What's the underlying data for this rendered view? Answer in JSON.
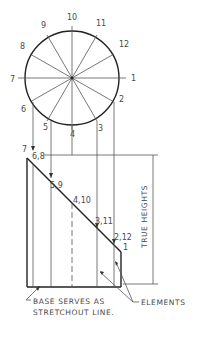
{
  "figure": {
    "type": "development-of-truncated-cylinder",
    "circle": {
      "center_x": 72,
      "center_y": 78,
      "radius": 47,
      "division_labels": [
        "1",
        "2",
        "3",
        "4",
        "5",
        "6",
        "7",
        "8",
        "9",
        "10",
        "11",
        "12"
      ]
    },
    "labels": {
      "p1": "1",
      "p2": "2",
      "p3": "3",
      "p4": "4",
      "p5": "5",
      "p6": "6",
      "p7": "7",
      "p8": "8",
      "p9": "9",
      "p10": "10",
      "p11": "11",
      "p12": "12",
      "front_7": "7",
      "front_68": "6,8",
      "front_59": "5,9",
      "front_410": "4,10",
      "front_311": "3,11",
      "front_212": "2,12",
      "front_1": "1"
    },
    "dimension_label": "TRUE HEIGHTS",
    "notes": {
      "base_line1": "BASE SERVES AS",
      "base_line2": "STRETCHOUT LINE.",
      "elements": "ELEMENTS"
    },
    "colors": {
      "ink": "#222222",
      "thin_line": "#555555",
      "text": "#4a4a4a",
      "background": "#ffffff"
    }
  }
}
